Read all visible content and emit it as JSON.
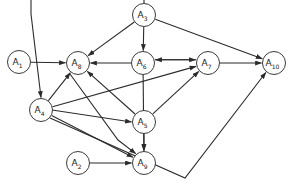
{
  "diagram": {
    "type": "directed-graph",
    "canvas": {
      "width": 293,
      "height": 190
    },
    "style": {
      "node_fill": "#ffffff",
      "node_stroke": "#3a3a3a",
      "edge_color": "#2b2b2b",
      "background": "#ffffff",
      "node_radius": 11.5
    },
    "nodes": [
      {
        "id": "A1",
        "base": "A",
        "sub": "1",
        "label": "A1",
        "x": 19,
        "y": 62
      },
      {
        "id": "A2",
        "base": "A",
        "sub": "2",
        "label": "A2",
        "x": 78,
        "y": 163
      },
      {
        "id": "A3",
        "base": "A",
        "sub": "3",
        "label": "A3",
        "x": 144,
        "y": 15
      },
      {
        "id": "A4",
        "base": "A",
        "sub": "4",
        "label": "A4",
        "x": 41,
        "y": 110
      },
      {
        "id": "A5",
        "base": "A",
        "sub": "5",
        "label": "A5",
        "x": 144,
        "y": 122
      },
      {
        "id": "A6",
        "base": "A",
        "sub": "6",
        "label": "A6",
        "x": 143,
        "y": 63
      },
      {
        "id": "A7",
        "base": "A",
        "sub": "7",
        "label": "A7",
        "x": 208,
        "y": 63
      },
      {
        "id": "A8",
        "base": "A",
        "sub": "8",
        "label": "A8",
        "x": 78,
        "y": 63
      },
      {
        "id": "A9",
        "base": "A",
        "sub": "9",
        "label": "A9",
        "x": 144,
        "y": 163
      },
      {
        "id": "A10",
        "base": "A",
        "sub": "10",
        "label": "A10",
        "x": 274,
        "y": 63
      }
    ],
    "edges": [
      {
        "from": "A1",
        "to": "A8",
        "kind": "straight"
      },
      {
        "from": "A3",
        "to": "A4",
        "kind": "polyline",
        "points": "144,3 144,-4 31,-4 31,14 31,98"
      },
      {
        "from": "A3",
        "to": "A6",
        "kind": "straight"
      },
      {
        "from": "A3",
        "to": "A8",
        "kind": "straight"
      },
      {
        "from": "A3",
        "to": "A10",
        "kind": "straight"
      },
      {
        "from": "A6",
        "to": "A7",
        "kind": "straight",
        "note": "upper of pair"
      },
      {
        "from": "A7",
        "to": "A6",
        "kind": "straight",
        "note": "lower of pair"
      },
      {
        "from": "A6",
        "to": "A8",
        "kind": "straight"
      },
      {
        "from": "A6",
        "to": "A9",
        "kind": "straight"
      },
      {
        "from": "A7",
        "to": "A10",
        "kind": "straight"
      },
      {
        "from": "A4",
        "to": "A8",
        "kind": "straight"
      },
      {
        "from": "A4",
        "to": "A7",
        "kind": "straight"
      },
      {
        "from": "A4",
        "to": "A5",
        "kind": "polyline",
        "points": "52,110 132,110"
      },
      {
        "from": "A4",
        "to": "A9",
        "kind": "straight"
      },
      {
        "from": "A4",
        "to": "A10",
        "kind": "polyline",
        "points": "50,118 185,178 274,75"
      },
      {
        "from": "A5",
        "to": "A8",
        "kind": "straight"
      },
      {
        "from": "A5",
        "to": "A7",
        "kind": "straight"
      },
      {
        "from": "A5",
        "to": "A9",
        "kind": "straight"
      },
      {
        "from": "A2",
        "to": "A9",
        "kind": "straight"
      },
      {
        "from": "A8",
        "to": "A9",
        "kind": "polyline",
        "points": "70,74 118,140 133,157"
      }
    ]
  }
}
